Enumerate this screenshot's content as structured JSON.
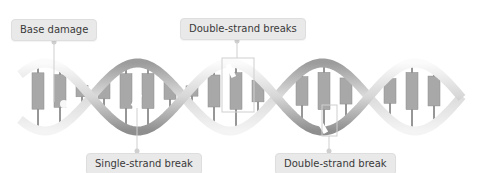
{
  "diagram": {
    "annotations": [
      {
        "id": "base-damage",
        "label": "Base damage",
        "position": "top"
      },
      {
        "id": "double-strand-breaks",
        "label": "Double-strand breaks",
        "position": "top"
      },
      {
        "id": "single-strand-break",
        "label": "Single-strand break",
        "position": "bottom"
      },
      {
        "id": "double-strand-break",
        "label": "Double-strand break",
        "position": "bottom"
      }
    ],
    "colors": {
      "callout_bg": "#e9e9e9",
      "callout_text": "#3a3a3a",
      "leader_line": "#cfcfcf",
      "backbone_light": "#f0f0f0",
      "backbone_dark": "#9a9a9a",
      "base_pair": "#a8a8a8",
      "base_pair_light": "#cdcdcd"
    }
  }
}
